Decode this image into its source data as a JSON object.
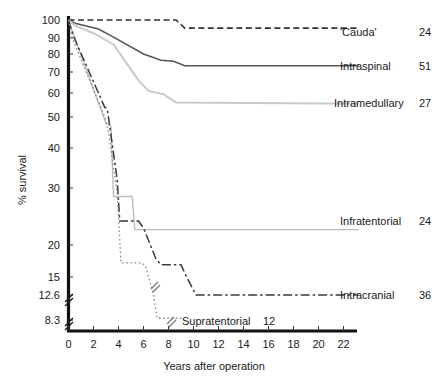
{
  "chart_data": {
    "type": "line",
    "title": "",
    "subtitle": "",
    "xlabel": "Years after operation",
    "ylabel": "% survival",
    "xlim": [
      0,
      23.5
    ],
    "ylim": [
      8.3,
      100
    ],
    "yscale": "log-broken",
    "grid": false,
    "legend_position": "right-inline",
    "xticks": [
      0,
      2,
      4,
      6,
      8,
      10,
      12,
      14,
      16,
      18,
      20,
      22
    ],
    "xtick_labels": [
      "0",
      "2",
      "4",
      "6",
      "8",
      "10",
      "12",
      "14",
      "16",
      "18",
      "20",
      "22"
    ],
    "yticks": [
      100,
      90,
      80,
      70,
      60,
      50,
      40,
      30,
      20,
      15,
      12.6,
      8.3
    ],
    "ytick_labels": [
      "100",
      "90",
      "80",
      "70",
      "60",
      "50",
      "40",
      "30",
      "20",
      "15",
      "12.6",
      "8.3"
    ],
    "axis_break": {
      "between": [
        12.6,
        8.3
      ],
      "marker": "double-slash"
    },
    "series": [
      {
        "name": "'Cauda'",
        "count": 24,
        "style": "dashed",
        "color": "#333333",
        "label_x": 23.8,
        "points": [
          [
            0,
            100
          ],
          [
            8.6,
            100
          ],
          [
            9.3,
            95.5
          ],
          [
            23.2,
            95.5
          ]
        ]
      },
      {
        "name": "Intraspinal",
        "count": 51,
        "style": "solid",
        "color": "#555555",
        "label_x": 23.8,
        "points": [
          [
            0,
            100
          ],
          [
            0.6,
            98
          ],
          [
            2.4,
            95
          ],
          [
            3.6,
            90.5
          ],
          [
            6.0,
            80
          ],
          [
            7.4,
            76.5
          ],
          [
            8.4,
            76
          ],
          [
            9.3,
            73.5
          ],
          [
            23.2,
            73.5
          ]
        ]
      },
      {
        "name": "Intramedullary",
        "count": 27,
        "style": "solid-light",
        "color": "#c9c9c9",
        "label_x": 23.8,
        "points": [
          [
            0,
            100
          ],
          [
            0.5,
            97
          ],
          [
            2.2,
            92
          ],
          [
            3.6,
            86
          ],
          [
            5.6,
            66
          ],
          [
            6.4,
            61
          ],
          [
            7.6,
            59.5
          ],
          [
            8.6,
            56
          ],
          [
            23.2,
            55.5
          ]
        ]
      },
      {
        "name": "Infratentorial",
        "count": 24,
        "style": "dotted-light",
        "color": "#bdbdbd",
        "label_x": 23.8,
        "points": [
          [
            0,
            100
          ],
          [
            0.4,
            92
          ],
          [
            3.0,
            48
          ],
          [
            3.4,
            47
          ],
          [
            3.6,
            28.5
          ],
          [
            5.1,
            28.5
          ],
          [
            5.3,
            22.7
          ],
          [
            23.2,
            22.7
          ]
        ]
      },
      {
        "name": "Intracranial",
        "count": 36,
        "style": "dash-dot",
        "color": "#3a3a3a",
        "label_x": 23.8,
        "points": [
          [
            0,
            100
          ],
          [
            0.4,
            91
          ],
          [
            2.9,
            54
          ],
          [
            3.1,
            53.5
          ],
          [
            3.9,
            32
          ],
          [
            4.1,
            24.2
          ],
          [
            5.6,
            24.2
          ],
          [
            6.0,
            23.0
          ],
          [
            7.0,
            17.8
          ],
          [
            7.4,
            16.9
          ],
          [
            9.0,
            16.9
          ],
          [
            9.4,
            15.2
          ],
          [
            10.2,
            12.6
          ],
          [
            23.2,
            12.6
          ]
        ]
      },
      {
        "name": "Supratentorial",
        "count": 12,
        "style": "dotted",
        "color": "#8a8a8a",
        "label_x": 11.5,
        "points": [
          [
            0,
            100
          ],
          [
            0.3,
            90
          ],
          [
            2.9,
            50
          ],
          [
            3.2,
            45
          ],
          [
            3.9,
            29
          ],
          [
            4.2,
            17.2
          ],
          [
            5.9,
            17.2
          ],
          [
            6.2,
            16.5
          ],
          [
            6.8,
            12.6
          ],
          [
            7.1,
            8.6
          ],
          [
            9.2,
            8.6
          ]
        ],
        "break_at": [
          6.95,
          11.0
        ]
      }
    ]
  },
  "legend": {
    "entries": [
      {
        "label": "'Cauda'",
        "count": "24"
      },
      {
        "label": "Intraspinal",
        "count": "51"
      },
      {
        "label": "Intramedullary",
        "count": "27"
      },
      {
        "label": "Infratentorial",
        "count": "24"
      },
      {
        "label": "Intracranial",
        "count": "36"
      },
      {
        "label": "Supratentorial",
        "count": "12"
      }
    ]
  },
  "axes": {
    "x_title": "Years after operation",
    "y_title": "% survival",
    "x_tick_labels": [
      "0",
      "2",
      "4",
      "6",
      "8",
      "10",
      "12",
      "14",
      "16",
      "18",
      "20",
      "22"
    ],
    "y_tick_labels": [
      "100",
      "90",
      "80",
      "70",
      "60",
      "50",
      "40",
      "30",
      "20",
      "15",
      "12.6",
      "8.3"
    ]
  },
  "colors": {
    "axis": "#111111",
    "text": "#1a1a1a",
    "cauda": "#333333",
    "intraspinal": "#555555",
    "intramedullary": "#c9c9c9",
    "infratentorial": "#bdbdbd",
    "intracranial": "#3a3a3a",
    "supratentorial": "#8a8a8a"
  }
}
